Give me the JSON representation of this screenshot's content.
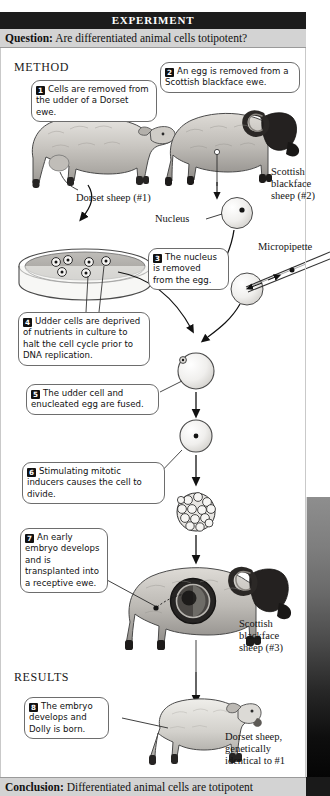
{
  "figure": {
    "banner": "EXPERIMENT",
    "question_label": "Question:",
    "question_text": "Are differentiated animal cells totipotent?",
    "conclusion_label": "Conclusion:",
    "conclusion_text": "Differentiated animal cells are totipotent",
    "method_heading": "METHOD",
    "results_heading": "RESULTS"
  },
  "steps": [
    {
      "num": "1",
      "text": "Cells are removed from the udder of a Dorset ewe."
    },
    {
      "num": "2",
      "text": "An egg is removed from a Scottish blackface ewe."
    },
    {
      "num": "3",
      "text": "The nucleus is removed from the egg."
    },
    {
      "num": "4",
      "text": "Udder cells are deprived of nutrients in culture to halt the cell cycle prior to DNA replication."
    },
    {
      "num": "5",
      "text": "The udder cell and enucleated egg are fused."
    },
    {
      "num": "6",
      "text": "Stimulating mitotic inducers causes the cell to divide."
    },
    {
      "num": "7",
      "text": "An early embryo develops and is transplanted into a receptive ewe."
    },
    {
      "num": "8",
      "text": "The embryo develops and Dolly is born."
    }
  ],
  "labels": {
    "dorset_sheep_1": "Dorset sheep (#1)",
    "scottish_sheep_2": "Scottish\nblackface\nsheep (#2)",
    "scottish_sheep_2_l1": "Scottish",
    "scottish_sheep_2_l2": "blackface",
    "scottish_sheep_2_l3": "sheep (#2)",
    "nucleus": "Nucleus",
    "micropipette": "Micropipette",
    "scottish_sheep_3_l1": "Scottish",
    "scottish_sheep_3_l2": "blackface",
    "scottish_sheep_3_l3": "sheep (#3)",
    "dolly_l1": "Dorset sheep,",
    "dolly_l2": "genetically",
    "dolly_l3": "identical to #1"
  },
  "colors": {
    "banner_bg": "#1c1c1c",
    "bar_bg": "#d3d3d3",
    "callout_border": "#6d6d6d",
    "ink": "#111111",
    "sheep_body": "#c9c6c1",
    "sheep_dark": "#2e2b29"
  }
}
